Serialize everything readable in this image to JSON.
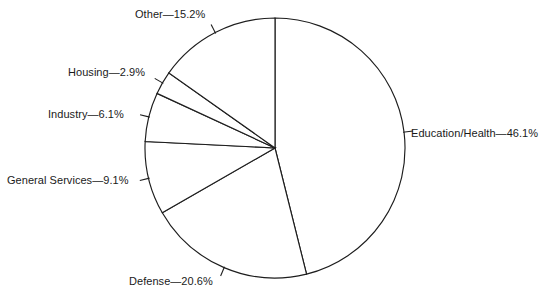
{
  "chart_data": {
    "type": "pie",
    "title": "",
    "subtitle": "",
    "xlabel": "",
    "ylabel": "",
    "legend_position": "none",
    "grid": false,
    "start_angle_deg": 90,
    "direction": "clockwise",
    "value_unit": "percent",
    "labels": [
      "Education/Health",
      "Defense",
      "General Services",
      "Industry",
      "Housing",
      "Other"
    ],
    "values": [
      46.1,
      20.6,
      9.1,
      6.1,
      2.9,
      15.2
    ],
    "slices": [
      {
        "name": "education-health",
        "label": "Education/Health",
        "value": 46.1,
        "label_text": "Education/Health—46.1%",
        "separator": "—",
        "value_text": "46.1%",
        "color": "#ffffff",
        "stroke": "#1d1d1d"
      },
      {
        "name": "defense",
        "label": "Defense",
        "value": 20.6,
        "label_text": "Defense—20.6%",
        "separator": "—",
        "value_text": "20.6%",
        "color": "#ffffff",
        "stroke": "#1d1d1d"
      },
      {
        "name": "general-services",
        "label": "General Services",
        "value": 9.1,
        "label_text": "General Services—9.1%",
        "separator": "—",
        "value_text": "9.1%",
        "color": "#ffffff",
        "stroke": "#1d1d1d"
      },
      {
        "name": "industry",
        "label": "Industry",
        "value": 6.1,
        "label_text": "Industry—6.1%",
        "separator": "—",
        "value_text": "6.1%",
        "color": "#ffffff",
        "stroke": "#1d1d1d"
      },
      {
        "name": "housing",
        "label": "Housing",
        "value": 2.9,
        "label_text": "Housing—2.9%",
        "separator": "—",
        "value_text": "2.9%",
        "color": "#ffffff",
        "stroke": "#1d1d1d"
      },
      {
        "name": "other",
        "label": "Other",
        "value": 15.2,
        "label_text": "Other—15.2%",
        "separator": "—",
        "value_text": "15.2%",
        "color": "#ffffff",
        "stroke": "#1d1d1d"
      }
    ],
    "total": 100.0
  },
  "geometry": {
    "center_x": 275,
    "center_y": 148,
    "radius": 130,
    "tick_length": 9
  },
  "colors": {
    "background": "#ffffff",
    "line": "#1d1d1d",
    "text": "#1a1a1a"
  }
}
